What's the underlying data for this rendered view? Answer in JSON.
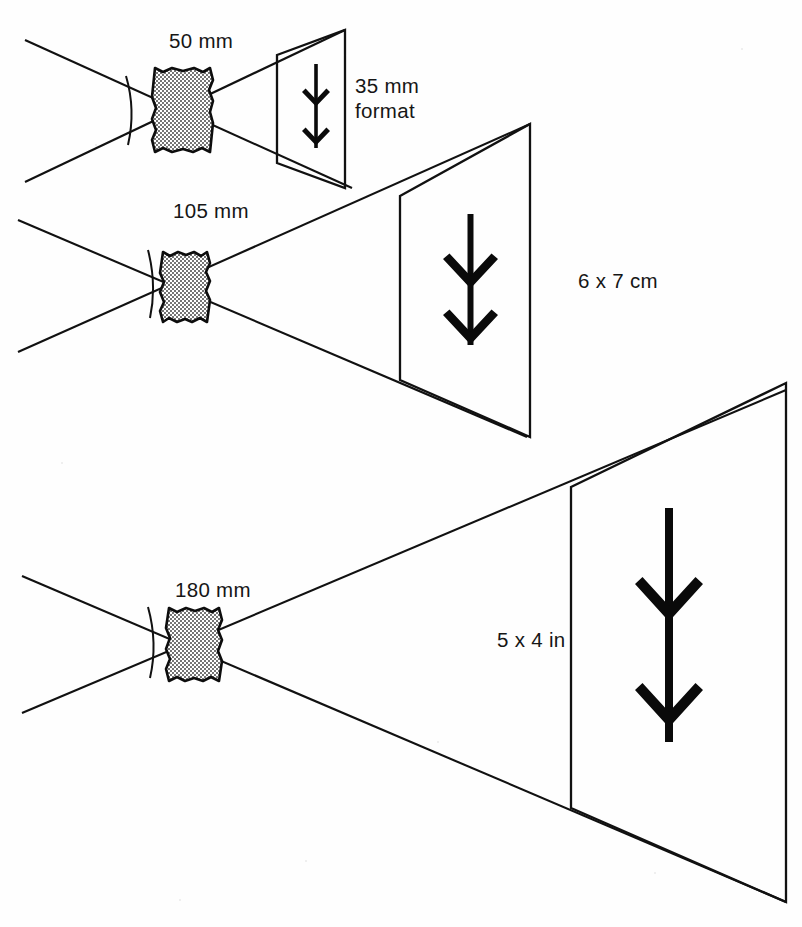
{
  "figure": {
    "background_color": "#fefefe",
    "ink_color": "#111111",
    "lens_fill_color": "#d7d7d7"
  },
  "setups": [
    {
      "id": "setup-35mm",
      "focal_length_label": "50 mm",
      "format_label_line1": "35 mm",
      "format_label_line2": "format",
      "format_label_full": "35 mm format",
      "lens_icon": "lens-icon",
      "arrow_icon": "double-chevron-down-arrow-icon",
      "angle_arc_icon": "angle-of-view-arc-icon"
    },
    {
      "id": "setup-6x7",
      "focal_length_label": "105 mm",
      "format_label_line1": "6 x 7 cm",
      "format_label_line2": "",
      "format_label_full": "6 x 7 cm",
      "lens_icon": "lens-icon",
      "arrow_icon": "double-chevron-down-arrow-icon",
      "angle_arc_icon": "angle-of-view-arc-icon"
    },
    {
      "id": "setup-5x4",
      "focal_length_label": "180 mm",
      "format_label_line1": "5 x 4 in",
      "format_label_line2": "",
      "format_label_full": "5 x 4 in",
      "lens_icon": "lens-icon",
      "arrow_icon": "double-chevron-down-arrow-icon",
      "angle_arc_icon": "angle-of-view-arc-icon"
    }
  ]
}
